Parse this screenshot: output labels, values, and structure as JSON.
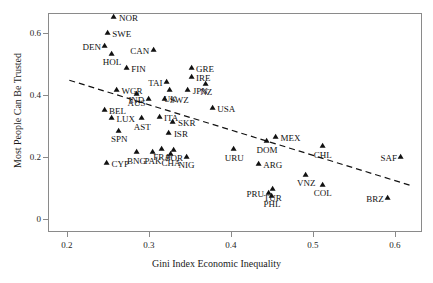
{
  "chart_data": {
    "type": "scatter",
    "title": "",
    "xlabel": "Gini Index Economic Inequality",
    "ylabel": "Most People Can Be Trusted",
    "xlim": [
      0.177,
      0.633
    ],
    "ylim": [
      -0.042,
      0.665
    ],
    "xticks": [
      0.2,
      0.3,
      0.4,
      0.5,
      0.6
    ],
    "xtick_labels": [
      "0.2",
      "0.3",
      "0.4",
      "0.5",
      "0.6"
    ],
    "yticks": [
      0,
      0.2,
      0.4,
      0.6
    ],
    "ytick_labels": [
      "0",
      "0.2",
      "0.4",
      "0.6"
    ],
    "grid": false,
    "legend": "none",
    "marker": "triangle-up",
    "marker_color": "#111111",
    "points": [
      {
        "label": "NOR",
        "x": 0.258,
        "y": 0.648,
        "side": "r"
      },
      {
        "label": "SWE",
        "x": 0.25,
        "y": 0.597,
        "side": "r"
      },
      {
        "label": "DEN",
        "x": 0.247,
        "y": 0.556,
        "side": "l"
      },
      {
        "label": "CAN",
        "x": 0.306,
        "y": 0.541,
        "side": "l"
      },
      {
        "label": "HOL",
        "x": 0.255,
        "y": 0.53,
        "side": "c"
      },
      {
        "label": "FIN",
        "x": 0.273,
        "y": 0.485,
        "side": "r"
      },
      {
        "label": "GRE",
        "x": 0.352,
        "y": 0.484,
        "side": "r"
      },
      {
        "label": "IRE",
        "x": 0.352,
        "y": 0.454,
        "side": "r"
      },
      {
        "label": "NZ",
        "x": 0.37,
        "y": 0.434,
        "side": "c"
      },
      {
        "label": "TAI",
        "x": 0.322,
        "y": 0.438,
        "side": "l"
      },
      {
        "label": "WGR",
        "x": 0.261,
        "y": 0.412,
        "side": "r"
      },
      {
        "label": "UK",
        "x": 0.326,
        "y": 0.412,
        "side": "c"
      },
      {
        "label": "JPN",
        "x": 0.348,
        "y": 0.412,
        "side": "r"
      },
      {
        "label": "AUS",
        "x": 0.285,
        "y": 0.399,
        "side": "c"
      },
      {
        "label": "IND",
        "x": 0.3,
        "y": 0.383,
        "side": "l"
      },
      {
        "label": "SWZ",
        "x": 0.32,
        "y": 0.383,
        "side": "r"
      },
      {
        "label": "USA",
        "x": 0.378,
        "y": 0.355,
        "side": "r"
      },
      {
        "label": "BEL",
        "x": 0.246,
        "y": 0.348,
        "side": "r"
      },
      {
        "label": "LUX",
        "x": 0.255,
        "y": 0.322,
        "side": "r"
      },
      {
        "label": "AST",
        "x": 0.292,
        "y": 0.322,
        "side": "c"
      },
      {
        "label": "ITA",
        "x": 0.313,
        "y": 0.325,
        "side": "r"
      },
      {
        "label": "SKR",
        "x": 0.33,
        "y": 0.31,
        "side": "r"
      },
      {
        "label": "SPN",
        "x": 0.264,
        "y": 0.282,
        "side": "c"
      },
      {
        "label": "ISR",
        "x": 0.325,
        "y": 0.275,
        "side": "r"
      },
      {
        "label": "MEX",
        "x": 0.455,
        "y": 0.262,
        "side": "r"
      },
      {
        "label": "DOM",
        "x": 0.444,
        "y": 0.248,
        "side": "c"
      },
      {
        "label": "CHL",
        "x": 0.512,
        "y": 0.232,
        "side": "c"
      },
      {
        "label": "URU",
        "x": 0.404,
        "y": 0.222,
        "side": "c"
      },
      {
        "label": "BNG",
        "x": 0.285,
        "y": 0.212,
        "side": "c"
      },
      {
        "label": "FRA",
        "x": 0.316,
        "y": 0.224,
        "side": "c"
      },
      {
        "label": "POR",
        "x": 0.331,
        "y": 0.22,
        "side": "c"
      },
      {
        "label": "PAK",
        "x": 0.305,
        "y": 0.212,
        "side": "c"
      },
      {
        "label": "CHA",
        "x": 0.327,
        "y": 0.205,
        "side": "c"
      },
      {
        "label": "NIG",
        "x": 0.346,
        "y": 0.197,
        "side": "c"
      },
      {
        "label": "SAF",
        "x": 0.608,
        "y": 0.196,
        "side": "l"
      },
      {
        "label": "CYP",
        "x": 0.249,
        "y": 0.177,
        "side": "r"
      },
      {
        "label": "ARG",
        "x": 0.434,
        "y": 0.175,
        "side": "r"
      },
      {
        "label": "VNZ",
        "x": 0.492,
        "y": 0.14,
        "side": "c"
      },
      {
        "label": "COL",
        "x": 0.512,
        "y": 0.108,
        "side": "c"
      },
      {
        "label": "TUR",
        "x": 0.451,
        "y": 0.092,
        "side": "c"
      },
      {
        "label": "PRU",
        "x": 0.446,
        "y": 0.08,
        "side": "l"
      },
      {
        "label": "BRZ",
        "x": 0.592,
        "y": 0.066,
        "side": "l"
      },
      {
        "label": "PHL",
        "x": 0.45,
        "y": 0.072,
        "side": "c"
      }
    ],
    "trendline": {
      "style": "dashed",
      "color": "#111111",
      "x_start": 0.203,
      "y_start": 0.448,
      "x_end": 0.622,
      "y_end": 0.106
    }
  },
  "caption": ""
}
